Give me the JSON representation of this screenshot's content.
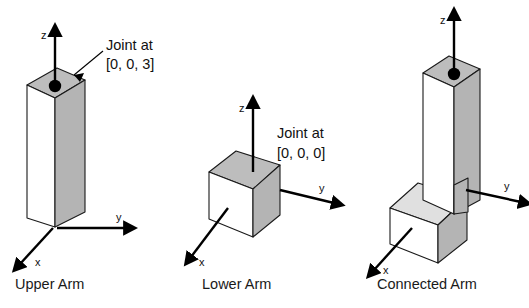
{
  "figure": {
    "background_color": "#ffffff",
    "ink_color": "#000000",
    "face_colors": {
      "front_light": "#ffffff",
      "side_mid": "#b4b4b4",
      "top_gray": "#bdbdbd",
      "top_pale": "#e0e0e0"
    },
    "panels": [
      {
        "id": "upper-arm",
        "caption": "Upper Arm",
        "callout": {
          "line1": "Joint at",
          "line2": "[0, 0, 3]"
        },
        "joint_marker": "joint-dot",
        "axes": [
          {
            "name": "z",
            "label": "z"
          },
          {
            "name": "y",
            "label": "y"
          },
          {
            "name": "x",
            "label": "x"
          }
        ]
      },
      {
        "id": "lower-arm",
        "caption": "Lower Arm",
        "callout": {
          "line1": "Joint at",
          "line2": "[0, 0, 0]"
        },
        "joint_marker": "none",
        "axes": [
          {
            "name": "z",
            "label": "z"
          },
          {
            "name": "y",
            "label": "y"
          },
          {
            "name": "x",
            "label": "x"
          }
        ]
      },
      {
        "id": "connected-arm",
        "caption": "Connected Arm",
        "callout": null,
        "joint_marker": "joint-dot",
        "axes": [
          {
            "name": "z",
            "label": "z"
          },
          {
            "name": "y",
            "label": "y"
          },
          {
            "name": "x",
            "label": "x"
          }
        ]
      }
    ]
  }
}
